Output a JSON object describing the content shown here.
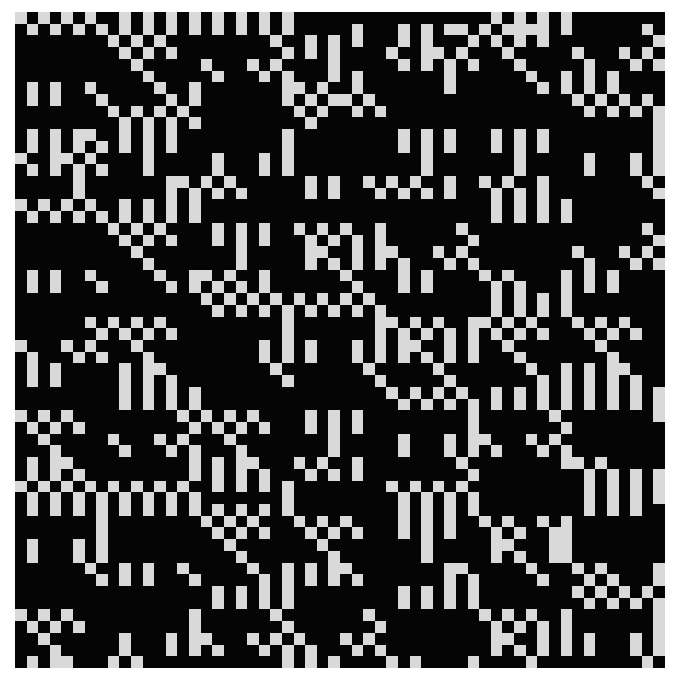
{
  "image": {
    "title": "Binary cellular pattern",
    "cols": 56,
    "rows_count": 56,
    "colors": {
      "on": "#d9d9d9",
      "off": "#050505",
      "background": "#ffffff"
    }
  },
  "on_cells": [
    [
      0,
      2,
      4,
      6,
      9,
      11,
      13,
      15,
      17,
      19,
      21,
      23,
      41,
      43,
      45,
      47
    ],
    [
      1,
      3,
      5,
      7,
      9,
      11,
      13,
      15,
      17,
      19,
      21,
      23,
      29,
      33,
      35,
      37,
      38,
      40,
      42,
      43,
      44,
      45,
      47,
      54
    ],
    [
      8,
      10,
      12,
      22,
      25,
      27,
      29,
      33,
      35,
      39,
      41,
      43,
      45,
      55
    ],
    [
      9,
      11,
      13,
      23,
      25,
      27,
      32,
      35,
      36,
      38,
      42,
      48,
      52,
      54
    ],
    [
      10,
      16,
      20,
      22,
      27,
      33,
      35,
      37,
      39,
      43,
      49,
      53,
      55
    ],
    [
      11,
      17,
      21,
      23,
      27,
      29,
      37,
      44,
      47,
      49,
      51
    ],
    [
      1,
      3,
      6,
      12,
      15,
      23,
      24,
      26,
      29,
      37,
      45,
      47,
      49,
      51
    ],
    [
      1,
      3,
      7,
      13,
      15,
      23,
      25,
      27,
      28,
      30,
      48,
      50,
      52,
      54
    ],
    [
      8,
      10,
      12,
      14,
      24,
      26,
      29,
      31,
      49,
      51,
      53,
      55
    ],
    [
      9,
      11,
      13,
      15,
      25,
      55
    ],
    [
      1,
      3,
      5,
      6,
      9,
      11,
      13,
      23,
      33,
      35,
      37,
      41,
      43,
      45,
      55
    ],
    [
      1,
      3,
      5,
      7,
      9,
      11,
      13,
      23,
      33,
      35,
      37,
      41,
      43,
      45,
      55
    ],
    [
      0,
      3,
      4,
      6,
      11,
      17,
      21,
      23,
      35,
      43,
      49,
      53,
      55
    ],
    [
      1,
      3,
      5,
      7,
      11,
      17,
      21,
      23,
      35,
      43,
      49,
      53,
      55
    ],
    [
      5,
      13,
      14,
      16,
      18,
      25,
      27,
      30,
      32,
      34,
      37,
      40,
      42,
      45,
      54
    ],
    [
      5,
      13,
      15,
      17,
      19,
      25,
      27,
      31,
      33,
      35,
      37,
      41,
      43,
      45,
      55
    ],
    [
      0,
      2,
      4,
      6,
      9,
      11,
      13,
      15,
      41,
      43,
      45,
      47
    ],
    [
      1,
      3,
      5,
      7,
      9,
      11,
      13,
      15,
      41,
      43,
      45,
      47
    ],
    [
      8,
      10,
      12,
      17,
      19,
      21,
      24,
      26,
      28,
      31,
      38,
      54
    ],
    [
      9,
      11,
      13,
      17,
      19,
      21,
      25,
      27,
      29,
      31,
      39,
      55
    ],
    [
      10,
      19,
      25,
      26,
      29,
      31,
      32,
      36,
      38,
      48,
      52,
      54
    ],
    [
      11,
      19,
      25,
      27,
      29,
      31,
      33,
      37,
      39,
      49,
      53,
      55
    ],
    [
      1,
      3,
      6,
      12,
      15,
      16,
      18,
      21,
      28,
      33,
      35,
      40,
      42,
      47,
      49,
      51
    ],
    [
      1,
      3,
      7,
      13,
      15,
      17,
      19,
      21,
      29,
      33,
      35,
      41,
      43,
      47,
      49,
      51
    ],
    [
      16,
      18,
      20,
      22,
      24,
      26,
      28,
      30,
      41,
      43,
      45,
      47
    ],
    [
      17,
      19,
      21,
      23,
      25,
      27,
      29,
      31,
      41,
      43,
      45,
      47
    ],
    [
      6,
      8,
      10,
      12,
      23,
      31,
      32,
      34,
      36,
      39,
      40,
      42,
      44,
      48,
      50,
      52
    ],
    [
      7,
      9,
      11,
      13,
      23,
      31,
      33,
      35,
      37,
      39,
      41,
      43,
      45,
      49,
      51,
      53
    ],
    [
      0,
      4,
      6,
      10,
      21,
      23,
      25,
      29,
      31,
      33,
      34,
      37,
      39,
      42,
      50
    ],
    [
      1,
      5,
      7,
      11,
      21,
      23,
      25,
      29,
      31,
      33,
      35,
      37,
      39,
      43,
      51
    ],
    [
      1,
      3,
      9,
      11,
      12,
      22,
      30,
      36,
      44,
      47,
      49,
      51,
      52
    ],
    [
      1,
      3,
      9,
      11,
      13,
      23,
      31,
      37,
      45,
      47,
      49,
      51,
      53
    ],
    [
      9,
      11,
      13,
      15,
      32,
      34,
      36,
      38,
      41,
      43,
      45,
      47,
      49,
      51,
      53,
      55
    ],
    [
      9,
      11,
      13,
      15,
      33,
      35,
      37,
      39,
      41,
      43,
      45,
      47,
      49,
      51,
      53,
      55
    ],
    [
      0,
      2,
      4,
      14,
      16,
      18,
      20,
      25,
      27,
      29,
      39,
      46,
      55
    ],
    [
      1,
      3,
      5,
      15,
      17,
      19,
      21,
      25,
      27,
      29,
      39,
      47
    ],
    [
      2,
      8,
      12,
      14,
      18,
      27,
      33,
      37,
      39,
      40,
      44,
      46
    ],
    [
      3,
      9,
      13,
      15,
      19,
      27,
      33,
      37,
      39,
      41,
      45,
      47
    ],
    [
      1,
      3,
      4,
      15,
      17,
      19,
      20,
      24,
      26,
      29,
      38,
      47,
      48,
      50
    ],
    [
      1,
      3,
      5,
      15,
      17,
      19,
      21,
      25,
      27,
      29,
      39,
      49,
      51,
      53,
      55
    ],
    [
      0,
      2,
      4,
      6,
      8,
      10,
      12,
      14,
      17,
      19,
      21,
      23,
      32,
      34,
      36,
      38,
      49,
      51,
      53,
      55
    ],
    [
      1,
      3,
      5,
      7,
      9,
      11,
      13,
      15,
      23,
      33,
      35,
      37,
      39,
      49,
      51,
      53,
      55
    ],
    [
      1,
      3,
      5,
      7,
      9,
      11,
      13,
      15,
      17,
      19,
      21,
      23,
      33,
      35,
      37,
      39,
      49,
      51,
      53
    ],
    [
      7,
      16,
      18,
      20,
      24,
      26,
      28,
      33,
      35,
      37,
      40,
      42,
      45,
      47
    ],
    [
      7,
      17,
      19,
      21,
      25,
      27,
      29,
      33,
      35,
      37,
      41,
      43,
      46,
      47
    ],
    [
      1,
      5,
      7,
      18,
      26,
      35,
      41,
      42,
      46,
      47
    ],
    [
      1,
      5,
      7,
      19,
      27,
      35,
      41,
      43,
      46,
      47
    ],
    [
      6,
      9,
      11,
      14,
      20,
      23,
      25,
      27,
      28,
      37,
      38,
      44,
      48,
      50,
      55
    ],
    [
      7,
      9,
      11,
      15,
      21,
      23,
      25,
      27,
      29,
      37,
      39,
      45,
      49,
      51,
      55
    ],
    [
      17,
      19,
      21,
      23,
      33,
      35,
      37,
      39,
      48,
      50,
      52,
      54
    ],
    [
      17,
      19,
      21,
      23,
      33,
      35,
      37,
      39,
      49,
      51,
      53,
      55
    ],
    [
      0,
      2,
      4,
      15,
      22,
      30,
      40,
      42,
      44,
      47,
      55
    ],
    [
      1,
      3,
      5,
      15,
      23,
      31,
      41,
      43,
      45,
      47,
      55
    ],
    [
      2,
      9,
      13,
      15,
      16,
      20,
      22,
      24,
      28,
      30,
      41,
      42,
      45,
      47,
      49,
      53,
      55
    ],
    [
      3,
      9,
      13,
      15,
      17,
      21,
      23,
      25,
      29,
      31,
      41,
      43,
      45,
      47,
      49,
      53,
      55
    ],
    [
      1,
      3,
      4,
      8,
      10,
      23,
      25,
      27,
      32,
      34,
      39,
      44,
      54
    ]
  ]
}
